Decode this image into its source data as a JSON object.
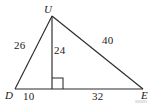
{
  "figure": {
    "type": "geometry-triangle-with-altitude",
    "background_color": "#ffffff",
    "stroke_color": "#2b2b2b",
    "vertices": {
      "apex": {
        "label": "U",
        "x": 52,
        "y": 16
      },
      "bottom_left": {
        "label": "D",
        "x": 15,
        "y": 89
      },
      "bottom_right": {
        "label": "E",
        "x": 143,
        "y": 89
      },
      "altitude_foot": {
        "label": "",
        "x": 52,
        "y": 89
      }
    },
    "vertex_labels": {
      "apex": "U",
      "left": "D",
      "right": "E"
    },
    "measures": {
      "left_side": "26",
      "altitude": "24",
      "right_side": "40",
      "base_left_segment": "10",
      "base_right_segment": "32"
    },
    "right_angle_marker": {
      "present": true,
      "at": "altitude-foot",
      "size": 11
    },
    "segments": [
      {
        "name": "DU",
        "from": "D",
        "to": "U",
        "measure": "26"
      },
      {
        "name": "UE",
        "from": "U",
        "to": "E",
        "measure": "40"
      },
      {
        "name": "DE",
        "from": "D",
        "to": "E",
        "measure": ""
      },
      {
        "name": "altitude-UF",
        "from": "U",
        "to": "F",
        "measure": "24"
      },
      {
        "name": "DF",
        "from": "D",
        "to": "F",
        "measure": "10"
      },
      {
        "name": "FE",
        "from": "F",
        "to": "E",
        "measure": "32"
      }
    ]
  }
}
